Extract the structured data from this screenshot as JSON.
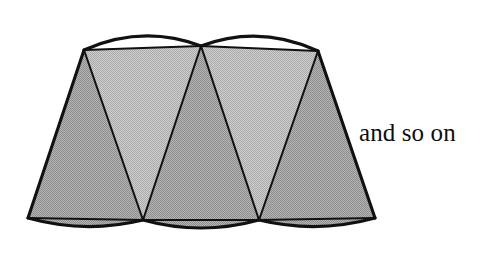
{
  "figure": {
    "canvas": {
      "width": 501,
      "height": 259,
      "background": "#ffffff"
    },
    "annotations": [
      {
        "id": "and-so-on",
        "text": "and so on",
        "x": 359,
        "y": 119,
        "font_size": 25
      }
    ],
    "colors": {
      "stroke": "#111111",
      "fill_light": "#bdbdbd",
      "fill_dark": "#a3a3a3",
      "background": "#ffffff",
      "text": "#0d0d0d"
    },
    "stroke_widths": {
      "outline": 3.1,
      "inner": 2.0
    },
    "geometry": {
      "top_points": [
        {
          "name": "top-left-vertex",
          "x": 84,
          "y": 50
        },
        {
          "name": "top-middle-vertex",
          "x": 201,
          "y": 46
        },
        {
          "name": "top-right-vertex",
          "x": 318,
          "y": 51
        }
      ],
      "bottom_points": [
        {
          "name": "bottom-left-vertex",
          "x": 28,
          "y": 218
        },
        {
          "name": "bottom-mid-left-vertex",
          "x": 143,
          "y": 220
        },
        {
          "name": "bottom-mid-right-vertex",
          "x": 259,
          "y": 220
        },
        {
          "name": "bottom-right-vertex",
          "x": 375,
          "y": 218
        }
      ],
      "top_arcs": [
        {
          "name": "top-arc-left",
          "from": [
            84,
            50
          ],
          "to": [
            201,
            46
          ],
          "bulge_y": -13
        },
        {
          "name": "top-arc-right",
          "from": [
            201,
            46
          ],
          "to": [
            318,
            51
          ],
          "bulge_y": -13
        }
      ],
      "bottom_arcs": [
        {
          "name": "bottom-arc-left",
          "from": [
            28,
            218
          ],
          "to": [
            143,
            220
          ],
          "bulge_y": 14
        },
        {
          "name": "bottom-arc-middle",
          "from": [
            143,
            220
          ],
          "to": [
            259,
            220
          ],
          "bulge_y": 14
        },
        {
          "name": "bottom-arc-right",
          "from": [
            259,
            220
          ],
          "to": [
            375,
            218
          ],
          "bulge_y": 14
        }
      ],
      "triangles": [
        {
          "name": "triangle-up-1",
          "shade": "dark",
          "points": [
            [
              28,
              218
            ],
            [
              143,
              220
            ],
            [
              84,
              50
            ]
          ]
        },
        {
          "name": "triangle-down-1",
          "shade": "light",
          "points": [
            [
              84,
              50
            ],
            [
              201,
              46
            ],
            [
              143,
              220
            ]
          ]
        },
        {
          "name": "triangle-up-2",
          "shade": "dark",
          "points": [
            [
              143,
              220
            ],
            [
              259,
              220
            ],
            [
              201,
              46
            ]
          ]
        },
        {
          "name": "triangle-down-2",
          "shade": "light",
          "points": [
            [
              201,
              46
            ],
            [
              318,
              51
            ],
            [
              259,
              220
            ]
          ]
        },
        {
          "name": "triangle-up-3",
          "shade": "dark",
          "points": [
            [
              259,
              220
            ],
            [
              375,
              218
            ],
            [
              318,
              51
            ]
          ]
        }
      ]
    }
  }
}
